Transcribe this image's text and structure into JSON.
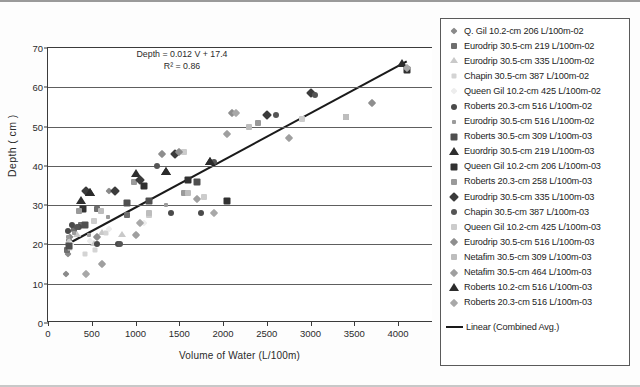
{
  "axes": {
    "y_title": "Depth ( cm )",
    "x_title": "Volume of Water (L/100m)",
    "y_ticks": [
      "0",
      "10",
      "20",
      "30",
      "40",
      "50",
      "60",
      "70"
    ],
    "x_ticks": [
      "0",
      "500",
      "1000",
      "1500",
      "2000",
      "2500",
      "3000",
      "3500",
      "4000"
    ]
  },
  "annotation": {
    "equation": "Depth = 0.012 V + 17.4",
    "r_squared": "R² = 0.86"
  },
  "legend": {
    "trend_label": "Linear (Combined Avg.)",
    "entries": [
      {
        "label": "Q. Gil 10.2-cm 206 L/100m-02",
        "shape": "di",
        "color": "#8a8a8a",
        "size": 5
      },
      {
        "label": "Eurodrip 30.5-cm 219 L/100m-02",
        "shape": "sq",
        "color": "#6e6e6e",
        "size": 6
      },
      {
        "label": "Eurodrip 30.5-cm 335 L/100m-02",
        "shape": "tr",
        "color": "#c9c9c9",
        "size": 6
      },
      {
        "label": "Chapin 30.5-cm 387 L/100m-02",
        "shape": "sq",
        "color": "#d4d4d4",
        "size": 5
      },
      {
        "label": "Queen Gil 10.2-cm 425 L/100m-02",
        "shape": "di",
        "color": "#ededed",
        "size": 5
      },
      {
        "label": "Roberts 20.3-cm 516 L/100m-02",
        "shape": "ci",
        "color": "#4a4a4a",
        "size": 6
      },
      {
        "label": "Eurodrip 30.5-cm 516 L/100m-02",
        "shape": "sq",
        "color": "#9b9b9b",
        "size": 4
      },
      {
        "label": "Roberts 30.5-cm 309 L/100m-03",
        "shape": "sq",
        "color": "#4f4f4f",
        "size": 7
      },
      {
        "label": "Euordrip 30.5-cm 219 L/100m-03",
        "shape": "tr",
        "color": "#2e2e2e",
        "size": 7
      },
      {
        "label": "Queen Gil 10.2-cm 206 L/100m-03",
        "shape": "sq",
        "color": "#313131",
        "size": 7
      },
      {
        "label": "Roberts 20.3-cm 258 L/100m-03",
        "shape": "sq",
        "color": "#9a9a9a",
        "size": 6
      },
      {
        "label": "Eurodrip 30.5-cm 335 L/100m-03",
        "shape": "di",
        "color": "#3b3b3b",
        "size": 7
      },
      {
        "label": "Chapin 30.5-cm 387 L/100m-03",
        "shape": "ci",
        "color": "#555555",
        "size": 6
      },
      {
        "label": "Queen Gil 10.2-cm 425 L/100m-03",
        "shape": "sq",
        "color": "#cccccc",
        "size": 6
      },
      {
        "label": "Eurodrip 30.5-cm 516 L/100m-03",
        "shape": "di",
        "color": "#8e8e8e",
        "size": 6
      },
      {
        "label": "Netafim 30.5-cm 309 L/100m-03",
        "shape": "sq",
        "color": "#bdbdbd",
        "size": 6
      },
      {
        "label": "Netafim 30.5-cm 464 L/100m-03",
        "shape": "di",
        "color": "#9f9f9f",
        "size": 6
      },
      {
        "label": "Roberts 10.2-cm 516 L/100m-03",
        "shape": "tr",
        "color": "#2b2b2b",
        "size": 7
      },
      {
        "label": "Roberts 20.3-cm 516 L/100m-03",
        "shape": "di",
        "color": "#a8a8a8",
        "size": 6
      }
    ]
  },
  "chart_data": {
    "type": "scatter",
    "title": "",
    "xlabel": "Volume of Water (L/100m)",
    "ylabel": "Depth ( cm )",
    "xlim": [
      0,
      4400
    ],
    "ylim": [
      0,
      70
    ],
    "grid": true,
    "legend_position": "right-outside",
    "trendline": {
      "type": "linear",
      "label": "Linear (Combined Avg.)",
      "equation": "Depth = 0.012 V + 17.4",
      "slope": 0.012,
      "intercept": 17.4,
      "r_squared": 0.86,
      "x_start": 210,
      "x_end": 4100
    },
    "series": [
      {
        "name": "Q. Gil 10.2-cm 206 L/100m-02",
        "shape": "di",
        "color": "#8a8a8a",
        "size": 5,
        "points": [
          [
            210,
            12.5
          ],
          [
            230,
            17.5
          ],
          [
            250,
            22.0
          ],
          [
            430,
            12.5
          ],
          [
            620,
            15.0
          ],
          [
            700,
            33.5
          ],
          [
            760,
            33.5
          ]
        ]
      },
      {
        "name": "Eurodrip 30.5-cm 219 L/100m-02",
        "shape": "sq",
        "color": "#6e6e6e",
        "size": 6,
        "points": [
          [
            215,
            18.5
          ],
          [
            235,
            20.5
          ],
          [
            300,
            24.0
          ],
          [
            380,
            25.0
          ],
          [
            560,
            29.0
          ],
          [
            900,
            27.5
          ]
        ]
      },
      {
        "name": "Eurodrip 30.5-cm 335 L/100m-02",
        "shape": "tr",
        "color": "#c9c9c9",
        "size": 6,
        "points": [
          [
            240,
            21.0
          ],
          [
            330,
            22.5
          ],
          [
            520,
            20.0
          ],
          [
            620,
            23.0
          ],
          [
            840,
            22.5
          ]
        ]
      },
      {
        "name": "Chapin 30.5-cm 387 L/100m-02",
        "shape": "sq",
        "color": "#d4d4d4",
        "size": 5,
        "points": [
          [
            250,
            19.0
          ],
          [
            420,
            17.5
          ],
          [
            540,
            18.5
          ],
          [
            660,
            23.0
          ],
          [
            1000,
            22.5
          ]
        ]
      },
      {
        "name": "Queen Gil 10.2-cm 425 L/100m-02",
        "shape": "di",
        "color": "#ededed",
        "size": 5,
        "points": [
          [
            260,
            20.0
          ],
          [
            480,
            21.0
          ],
          [
            700,
            24.0
          ],
          [
            1100,
            25.5
          ]
        ]
      },
      {
        "name": "Roberts 20.3-cm 516 L/100m-02",
        "shape": "ci",
        "color": "#4a4a4a",
        "size": 6,
        "points": [
          [
            225,
            23.5
          ],
          [
            270,
            25.0
          ],
          [
            350,
            24.5
          ],
          [
            560,
            20.0
          ],
          [
            800,
            20.0
          ],
          [
            1400,
            28.0
          ],
          [
            1750,
            28.0
          ]
        ]
      },
      {
        "name": "Eurodrip 30.5-cm 516 L/100m-02",
        "shape": "sq",
        "color": "#9b9b9b",
        "size": 4,
        "points": [
          [
            230,
            22.0
          ],
          [
            300,
            23.0
          ],
          [
            470,
            22.5
          ],
          [
            690,
            27.0
          ],
          [
            1350,
            30.0
          ]
        ]
      },
      {
        "name": "Roberts 30.5-cm 309 L/100m-03",
        "shape": "sq",
        "color": "#4f4f4f",
        "size": 7,
        "points": [
          [
            240,
            19.5
          ],
          [
            420,
            25.0
          ],
          [
            900,
            30.5
          ],
          [
            1150,
            31.0
          ],
          [
            1700,
            36.0
          ]
        ]
      },
      {
        "name": "Euordrip 30.5-cm 219 L/100m-03",
        "shape": "tr",
        "color": "#2e2e2e",
        "size": 7,
        "points": [
          [
            380,
            31.0
          ],
          [
            480,
            33.0
          ],
          [
            1000,
            38.0
          ],
          [
            1350,
            38.5
          ],
          [
            1850,
            41.0
          ]
        ]
      },
      {
        "name": "Queen Gil 10.2-cm 206 L/100m-03",
        "shape": "sq",
        "color": "#313131",
        "size": 7,
        "points": [
          [
            400,
            29.0
          ],
          [
            1100,
            35.0
          ],
          [
            1600,
            36.5
          ],
          [
            2050,
            31.0
          ],
          [
            4100,
            64.5
          ]
        ]
      },
      {
        "name": "Roberts 20.3-cm 258 L/100m-03",
        "shape": "sq",
        "color": "#9a9a9a",
        "size": 6,
        "points": [
          [
            350,
            28.5
          ],
          [
            980,
            36.0
          ],
          [
            1550,
            33.0
          ],
          [
            2400,
            51.0
          ],
          [
            3400,
            52.5
          ]
        ]
      },
      {
        "name": "Eurodrip 30.5-cm 335 L/100m-03",
        "shape": "di",
        "color": "#3b3b3b",
        "size": 7,
        "points": [
          [
            430,
            33.5
          ],
          [
            760,
            33.5
          ],
          [
            1050,
            36.5
          ],
          [
            1450,
            43.0
          ],
          [
            2500,
            53.0
          ],
          [
            3000,
            58.5
          ]
        ]
      },
      {
        "name": "Chapin 30.5-cm 387 L/100m-03",
        "shape": "ci",
        "color": "#555555",
        "size": 6,
        "points": [
          [
            330,
            24.5
          ],
          [
            820,
            20.0
          ],
          [
            1250,
            40.0
          ],
          [
            1900,
            41.0
          ],
          [
            2600,
            53.0
          ],
          [
            3050,
            58.0
          ]
        ]
      },
      {
        "name": "Queen Gil 10.2-cm 425 L/100m-03",
        "shape": "sq",
        "color": "#cccccc",
        "size": 6,
        "points": [
          [
            520,
            26.0
          ],
          [
            1150,
            27.5
          ],
          [
            1550,
            43.5
          ],
          [
            1780,
            32.0
          ],
          [
            2900,
            52.0
          ]
        ]
      },
      {
        "name": "Eurodrip 30.5-cm 516 L/100m-03",
        "shape": "di",
        "color": "#8e8e8e",
        "size": 6,
        "points": [
          [
            560,
            22.0
          ],
          [
            1300,
            43.0
          ],
          [
            1500,
            43.5
          ],
          [
            2100,
            53.5
          ],
          [
            3700,
            56.0
          ]
        ]
      },
      {
        "name": "Netafim 30.5-cm 309 L/100m-03",
        "shape": "sq",
        "color": "#bdbdbd",
        "size": 6,
        "points": [
          [
            600,
            28.5
          ],
          [
            1150,
            28.0
          ],
          [
            1600,
            33.0
          ],
          [
            2300,
            50.0
          ],
          [
            3400,
            52.5
          ]
        ]
      },
      {
        "name": "Netafim 30.5-cm 464 L/100m-03",
        "shape": "di",
        "color": "#9f9f9f",
        "size": 6,
        "points": [
          [
            620,
            15.0
          ],
          [
            1000,
            22.5
          ],
          [
            1700,
            31.5
          ],
          [
            2050,
            48.0
          ],
          [
            2750,
            47.0
          ]
        ]
      },
      {
        "name": "Roberts 10.2-cm 516 L/100m-03",
        "shape": "tr",
        "color": "#2b2b2b",
        "size": 7,
        "points": [
          [
            480,
            33.0
          ],
          [
            1350,
            38.5
          ],
          [
            1850,
            41.0
          ],
          [
            4050,
            66.0
          ]
        ]
      },
      {
        "name": "Roberts 20.3-cm 516 L/100m-03",
        "shape": "di",
        "color": "#a8a8a8",
        "size": 6,
        "points": [
          [
            430,
            12.5
          ],
          [
            1050,
            25.5
          ],
          [
            1900,
            28.0
          ],
          [
            2150,
            53.5
          ],
          [
            4100,
            65.0
          ]
        ]
      }
    ]
  }
}
